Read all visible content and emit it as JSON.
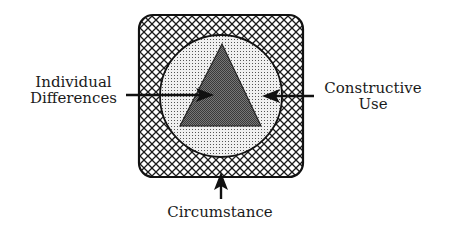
{
  "diagram": {
    "layers": [
      {
        "name": "Circumstance",
        "shape": "rounded-square",
        "fill": "crosshatch"
      },
      {
        "name": "Constructive Use",
        "shape": "circle",
        "fill": "dotted"
      },
      {
        "name": "Individual Differences",
        "shape": "triangle",
        "fill": "dark-gray"
      }
    ],
    "labels": {
      "left_line1": "Individual",
      "left_line2": "Differences",
      "right_line1": "Constructive",
      "right_line2": "Use",
      "bottom": "Circumstance"
    },
    "colors": {
      "stroke": "#111111",
      "triangle_fill": "#6b6b6b",
      "dot_bg": "#e4e4e4",
      "background": "#ffffff"
    }
  }
}
